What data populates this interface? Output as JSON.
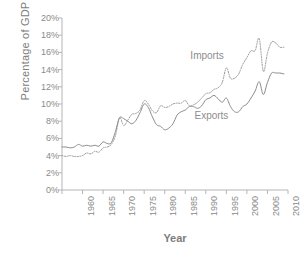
{
  "chart_data": {
    "type": "line",
    "title": "",
    "xlabel": "Year",
    "ylabel": "Percentage of GDP",
    "xlim": [
      1960,
      2015
    ],
    "ylim": [
      0,
      20
    ],
    "grid": false,
    "legend_position": "inline-annotations",
    "xticks": [
      "1960",
      "1965",
      "1970",
      "1975",
      "1980",
      "1985",
      "1990",
      "1995",
      "2000",
      "2005",
      "2010",
      "2015"
    ],
    "yticks": [
      "0%",
      "2%",
      "4%",
      "6%",
      "8%",
      "10%",
      "12%",
      "14%",
      "16%",
      "18%",
      "20%"
    ],
    "annotations": [
      {
        "text": "Imports",
        "x": 2000,
        "y": 15.6
      },
      {
        "text": "Exports",
        "x": 2001,
        "y": 8.6
      }
    ],
    "series": [
      {
        "name": "Imports",
        "style": "dotted",
        "color": "#9a9a9a",
        "x": [
          1960,
          1961,
          1962,
          1963,
          1964,
          1965,
          1966,
          1967,
          1968,
          1969,
          1970,
          1971,
          1972,
          1973,
          1974,
          1975,
          1976,
          1977,
          1978,
          1979,
          1980,
          1981,
          1982,
          1983,
          1984,
          1985,
          1986,
          1987,
          1988,
          1989,
          1990,
          1991,
          1992,
          1993,
          1994,
          1995,
          1996,
          1997,
          1998,
          1999,
          2000,
          2001,
          2002,
          2003,
          2004,
          2005,
          2006,
          2007,
          2008,
          2009,
          2010,
          2011,
          2012,
          2013,
          2014
        ],
        "values": [
          4.0,
          3.9,
          4.0,
          3.9,
          3.9,
          4.0,
          4.3,
          4.2,
          4.5,
          4.4,
          4.9,
          5.0,
          5.3,
          6.3,
          8.4,
          7.5,
          8.1,
          8.8,
          8.9,
          9.3,
          10.4,
          10.0,
          9.2,
          9.0,
          9.8,
          9.6,
          9.7,
          10.0,
          10.1,
          10.1,
          10.4,
          9.8,
          9.9,
          10.2,
          10.7,
          11.2,
          11.3,
          11.7,
          11.9,
          12.5,
          14.2,
          13.0,
          13.0,
          13.5,
          14.6,
          15.4,
          16.2,
          16.2,
          17.6,
          13.8,
          15.9,
          17.2,
          17.1,
          16.6,
          16.6
        ]
      },
      {
        "name": "Exports",
        "style": "solid",
        "color": "#8b8b8b",
        "x": [
          1960,
          1961,
          1962,
          1963,
          1964,
          1965,
          1966,
          1967,
          1968,
          1969,
          1970,
          1971,
          1972,
          1973,
          1974,
          1975,
          1976,
          1977,
          1978,
          1979,
          1980,
          1981,
          1982,
          1983,
          1984,
          1985,
          1986,
          1987,
          1988,
          1989,
          1990,
          1991,
          1992,
          1993,
          1994,
          1995,
          1996,
          1997,
          1998,
          1999,
          2000,
          2001,
          2002,
          2003,
          2004,
          2005,
          2006,
          2007,
          2008,
          2009,
          2010,
          2011,
          2012,
          2013,
          2014
        ],
        "values": [
          5.0,
          5.0,
          4.9,
          5.0,
          5.3,
          5.1,
          5.2,
          5.1,
          5.2,
          5.1,
          5.6,
          5.4,
          5.5,
          6.8,
          8.4,
          8.3,
          8.0,
          7.7,
          8.1,
          9.0,
          10.0,
          9.6,
          8.5,
          7.6,
          7.4,
          7.0,
          7.2,
          7.7,
          8.7,
          9.1,
          9.3,
          9.7,
          9.7,
          9.5,
          9.8,
          10.5,
          10.7,
          11.0,
          10.6,
          10.2,
          10.7,
          9.7,
          9.1,
          9.1,
          9.7,
          10.0,
          10.7,
          11.5,
          12.6,
          11.1,
          12.5,
          13.6,
          13.6,
          13.6,
          13.5
        ]
      }
    ]
  }
}
